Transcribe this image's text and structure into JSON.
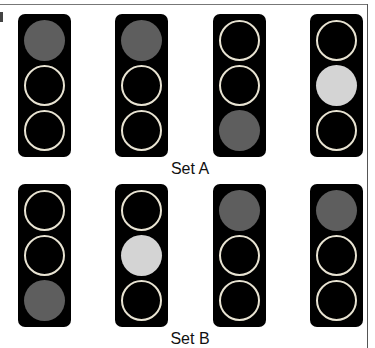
{
  "sets": [
    {
      "label": "Set A",
      "lights": [
        {
          "top": "dark",
          "middle": "off",
          "bottom": "off"
        },
        {
          "top": "dark",
          "middle": "off",
          "bottom": "off"
        },
        {
          "top": "off",
          "middle": "off",
          "bottom": "dark"
        },
        {
          "top": "off",
          "middle": "light",
          "bottom": "off"
        }
      ]
    },
    {
      "label": "Set B",
      "lights": [
        {
          "top": "off",
          "middle": "off",
          "bottom": "dark"
        },
        {
          "top": "off",
          "middle": "light",
          "bottom": "off"
        },
        {
          "top": "dark",
          "middle": "off",
          "bottom": "off"
        },
        {
          "top": "dark",
          "middle": "off",
          "bottom": "off"
        }
      ]
    }
  ],
  "colors": {
    "housing": "#000000",
    "lamp_lit_dark": "#5e5e5e",
    "lamp_lit_light": "#d4d4d4",
    "lamp_off_ring": "#e8e3d2"
  }
}
